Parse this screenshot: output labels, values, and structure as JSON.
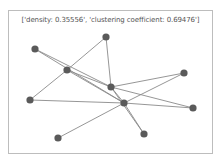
{
  "figure": {
    "title": "['density: 0.35556', 'clustering coefficient: 0.69476']",
    "metrics": {
      "density": "0.35556",
      "clustering_coefficient": "0.69476"
    }
  },
  "style": {
    "node_color": "#5a5a5a",
    "edge_color": "#8a8a8a",
    "frame_color": "#bdbdbd"
  },
  "graph": {
    "nodes": [
      {
        "id": "A",
        "x": 35,
        "y": 49
      },
      {
        "id": "B",
        "x": 67,
        "y": 70
      },
      {
        "id": "C",
        "x": 106,
        "y": 37
      },
      {
        "id": "D",
        "x": 111,
        "y": 87
      },
      {
        "id": "E",
        "x": 124,
        "y": 103
      },
      {
        "id": "F",
        "x": 184,
        "y": 73
      },
      {
        "id": "G",
        "x": 193,
        "y": 108
      },
      {
        "id": "H",
        "x": 30,
        "y": 100
      },
      {
        "id": "I",
        "x": 58,
        "y": 138
      },
      {
        "id": "J",
        "x": 144,
        "y": 134
      }
    ],
    "edges": [
      [
        "A",
        "D"
      ],
      [
        "A",
        "E"
      ],
      [
        "B",
        "C"
      ],
      [
        "B",
        "D"
      ],
      [
        "B",
        "E"
      ],
      [
        "B",
        "H"
      ],
      [
        "C",
        "D"
      ],
      [
        "D",
        "E"
      ],
      [
        "D",
        "F"
      ],
      [
        "D",
        "G"
      ],
      [
        "D",
        "J"
      ],
      [
        "E",
        "F"
      ],
      [
        "E",
        "G"
      ],
      [
        "E",
        "I"
      ],
      [
        "E",
        "J"
      ],
      [
        "H",
        "E"
      ]
    ]
  }
}
